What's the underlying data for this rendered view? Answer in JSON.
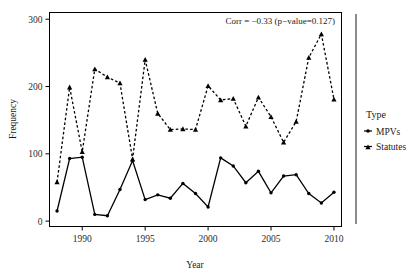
{
  "chart_data": {
    "type": "line",
    "title": "",
    "xlabel": "Year",
    "ylabel": "Frequency",
    "xlim": [
      1987.4,
      2010.6
    ],
    "ylim": [
      -8,
      310
    ],
    "xticks": [
      1990,
      1995,
      2000,
      2005,
      2010
    ],
    "yticks": [
      0,
      100,
      200,
      300
    ],
    "grid": false,
    "legend_position": "right",
    "legend_title": "Type",
    "annotation": "Corr = −0.33 (p−value=0.127)",
    "x": [
      1988,
      1989,
      1990,
      1991,
      1992,
      1993,
      1994,
      1995,
      1996,
      1997,
      1998,
      1999,
      2000,
      2001,
      2002,
      2003,
      2004,
      2005,
      2006,
      2007,
      2008,
      2009,
      2010
    ],
    "series": [
      {
        "name": "MPVs",
        "linestyle": "solid",
        "marker": "point",
        "color": "#000000",
        "values": [
          15,
          93,
          95,
          10,
          8,
          47,
          90,
          32,
          39,
          34,
          56,
          41,
          21,
          94,
          82,
          57,
          74,
          42,
          67,
          69,
          41,
          27,
          43
        ]
      },
      {
        "name": "Statutes",
        "linestyle": "dashed",
        "marker": "triangle",
        "color": "#000000",
        "values": [
          58,
          199,
          103,
          226,
          214,
          205,
          92,
          240,
          160,
          136,
          137,
          136,
          201,
          180,
          182,
          141,
          184,
          155,
          117,
          148,
          243,
          278,
          181
        ]
      }
    ]
  },
  "axis": {
    "y_tick_labels": [
      "0",
      "100",
      "200",
      "300"
    ],
    "x_tick_labels": [
      "1990",
      "1995",
      "2000",
      "2005",
      "2010"
    ],
    "y_title": "Frequency",
    "x_title": "Year"
  },
  "legend": {
    "title": "Type",
    "entries": [
      {
        "label": "MPVs",
        "style": "solid"
      },
      {
        "label": "Statutes",
        "style": "dashed"
      }
    ]
  },
  "annotation": {
    "text": "Corr = −0.33 (p−value=0.127)"
  }
}
